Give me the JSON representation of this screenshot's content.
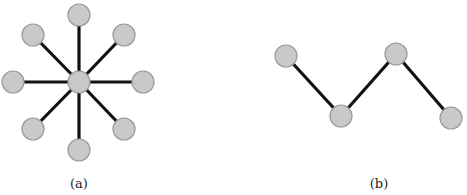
{
  "figures": [
    {
      "id": "a",
      "caption": "(a)",
      "type": "star-graph",
      "nodes": [
        {
          "x": 79,
          "y": 82
        },
        {
          "x": 79,
          "y": 15
        },
        {
          "x": 124,
          "y": 35
        },
        {
          "x": 143,
          "y": 82
        },
        {
          "x": 124,
          "y": 129
        },
        {
          "x": 79,
          "y": 150
        },
        {
          "x": 33,
          "y": 129
        },
        {
          "x": 13,
          "y": 82
        },
        {
          "x": 33,
          "y": 35
        }
      ],
      "edges": [
        [
          0,
          1
        ],
        [
          0,
          2
        ],
        [
          0,
          3
        ],
        [
          0,
          4
        ],
        [
          0,
          5
        ],
        [
          0,
          6
        ],
        [
          0,
          7
        ],
        [
          0,
          8
        ]
      ],
      "caption_pos": {
        "x": 79,
        "y": 188
      }
    },
    {
      "id": "b",
      "caption": "(b)",
      "type": "path-graph",
      "nodes": [
        {
          "x": 286,
          "y": 56
        },
        {
          "x": 341,
          "y": 116
        },
        {
          "x": 396,
          "y": 54
        },
        {
          "x": 451,
          "y": 118
        }
      ],
      "edges": [
        [
          0,
          1
        ],
        [
          1,
          2
        ],
        [
          2,
          3
        ]
      ],
      "caption_pos": {
        "x": 379,
        "y": 188
      }
    }
  ],
  "style": {
    "node_radius": 11,
    "node_fill": "#c9c9c9",
    "edge_color": "#111111"
  }
}
